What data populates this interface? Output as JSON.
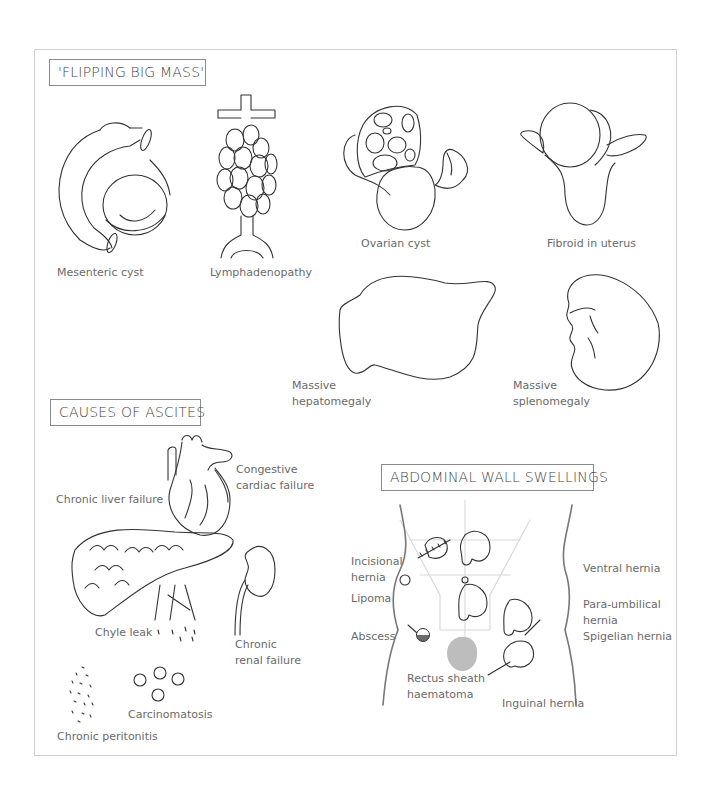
{
  "sections": {
    "flipping": {
      "title": "'FLIPPING BIG MASS'",
      "items": [
        {
          "label": "Mesenteric cyst"
        },
        {
          "label": "Lymphadenopathy"
        },
        {
          "label": "Ovarian cyst"
        },
        {
          "label": "Fibroid in uterus"
        },
        {
          "label_line1": "Massive",
          "label_line2": "hepatomegaly"
        },
        {
          "label_line1": "Massive",
          "label_line2": "splenomegaly"
        }
      ]
    },
    "ascites": {
      "title": "CAUSES OF ASCITES",
      "items": [
        {
          "label": "Chronic liver failure"
        },
        {
          "label_line1": "Congestive",
          "label_line2": "cardiac failure"
        },
        {
          "label": "Chyle leak"
        },
        {
          "label_line1": "Chronic",
          "label_line2": "renal failure"
        },
        {
          "label": "Carcinomatosis"
        },
        {
          "label": "Chronic peritonitis"
        }
      ]
    },
    "abdominal_wall": {
      "title": "ABDOMINAL WALL SWELLINGS",
      "left_labels": [
        {
          "label_line1": "Incisional",
          "label_line2": "hernia"
        },
        {
          "label": "Lipoma"
        },
        {
          "label": "Abscess"
        },
        {
          "label_line1": "Rectus sheath",
          "label_line2": "haematoma"
        }
      ],
      "right_labels": [
        {
          "label": "Ventral hernia"
        },
        {
          "label_line1": "Para-umbilical",
          "label_line2": "hernia"
        },
        {
          "label": "Spigelian hernia"
        },
        {
          "label": "Inguinal hernia"
        }
      ]
    }
  },
  "colors": {
    "stroke": "#333333",
    "label": "#6a6a6a",
    "frame": "#cfcfcf",
    "haematoma_fill": "#bdbdbd",
    "abscess_fill": "#6b6b6b"
  }
}
